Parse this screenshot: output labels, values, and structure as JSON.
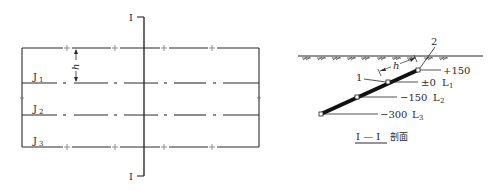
{
  "plan_view": {
    "section_mark_top": "I",
    "section_mark_bottom": "I",
    "dimension_label": "h",
    "rows": [
      {
        "label": "J",
        "sub": "1"
      },
      {
        "label": "J",
        "sub": "2"
      },
      {
        "label": "J",
        "sub": "3"
      }
    ]
  },
  "section_view": {
    "callouts": [
      "1",
      "2"
    ],
    "dimension_label": "h",
    "elevations": [
      {
        "value": "+150",
        "level": "",
        "level_sub": ""
      },
      {
        "value": "±0",
        "level": "L",
        "level_sub": "1"
      },
      {
        "value": "−150",
        "level": "L",
        "level_sub": "2"
      },
      {
        "value": "−300",
        "level": "L",
        "level_sub": "3"
      }
    ],
    "caption_mark": "I — I",
    "caption_text": "剖面"
  },
  "colors": {
    "line": "#2a2a2a"
  }
}
